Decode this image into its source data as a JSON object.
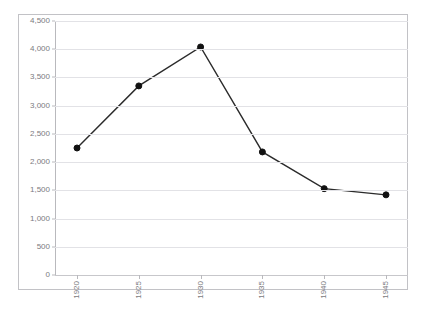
{
  "chart_data": {
    "type": "line",
    "title": "",
    "xlabel": "",
    "ylabel": "",
    "categories": [
      "1920",
      "1925",
      "1930",
      "1935",
      "1940",
      "1945"
    ],
    "values": [
      2250,
      3350,
      4040,
      2180,
      1530,
      1420
    ],
    "series": [
      {
        "name": "series-1",
        "values": [
          2250,
          3350,
          4040,
          2180,
          1530,
          1420
        ]
      }
    ],
    "ylim": [
      0,
      4500
    ],
    "y_ticks": [
      "0",
      "500",
      "1,000",
      "1,500",
      "2,000",
      "2,500",
      "3,000",
      "3,500",
      "4,000",
      "4,500"
    ],
    "y_tick_values": [
      0,
      500,
      1000,
      1500,
      2000,
      2500,
      3000,
      3500,
      4000,
      4500
    ],
    "x_tick_labels": [
      "1920",
      "1925",
      "1930",
      "1935",
      "1940",
      "1945"
    ],
    "grid": true,
    "legend": false,
    "legend_position": "none",
    "marker": "circle",
    "line_color": "#2b2b2b",
    "marker_color": "#111111",
    "grid_color": "#e2e2e6",
    "axis_color": "#b9b9bd",
    "plot_background": "#ffffff"
  }
}
